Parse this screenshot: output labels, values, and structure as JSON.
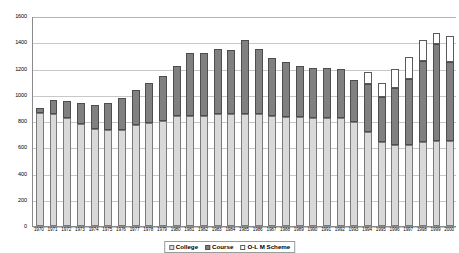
{
  "chart_data": {
    "type": "bar",
    "stacked": true,
    "title": "",
    "xlabel": "",
    "ylabel": "",
    "ylim": [
      0,
      1600
    ],
    "ytick_step": 200,
    "yticks": [
      0,
      200,
      400,
      600,
      800,
      1000,
      1200,
      1400,
      1600
    ],
    "grid": true,
    "legend_position": "bottom",
    "categories": [
      "1970",
      "1971",
      "1972",
      "1973",
      "1974",
      "1975",
      "1976",
      "1977",
      "1978",
      "1979",
      "1980",
      "1981",
      "1982",
      "1983",
      "1984",
      "1985",
      "1986",
      "1987",
      "1988",
      "1989",
      "1990",
      "1991",
      "1992",
      "1993",
      "1994",
      "1995",
      "1996",
      "1997",
      "1998",
      "1999",
      "2000"
    ],
    "series": [
      {
        "name": "College",
        "color": "#d9d9d9",
        "values": [
          860,
          855,
          820,
          775,
          740,
          730,
          735,
          770,
          785,
          800,
          840,
          840,
          840,
          850,
          850,
          855,
          850,
          840,
          830,
          830,
          825,
          825,
          820,
          790,
          720,
          640,
          620,
          620,
          640,
          650,
          650
        ]
      },
      {
        "name": "Course",
        "color": "#808080",
        "values": [
          40,
          105,
          130,
          165,
          185,
          205,
          240,
          270,
          305,
          345,
          380,
          480,
          480,
          500,
          490,
          560,
          500,
          440,
          420,
          390,
          380,
          380,
          380,
          320,
          360,
          340,
          430,
          500,
          615,
          740,
          600
        ]
      },
      {
        "name": "O-L M Scheme",
        "color": "#ffffff",
        "values": [
          0,
          0,
          0,
          0,
          0,
          0,
          0,
          0,
          0,
          0,
          0,
          0,
          0,
          0,
          0,
          0,
          0,
          0,
          0,
          0,
          0,
          0,
          0,
          0,
          95,
          110,
          150,
          170,
          160,
          80,
          200
        ]
      }
    ],
    "totals": [
      900,
      960,
      950,
      940,
      925,
      935,
      975,
      1040,
      1090,
      1145,
      1220,
      1320,
      1320,
      1350,
      1340,
      1415,
      1350,
      1280,
      1250,
      1220,
      1205,
      1205,
      1200,
      1110,
      1175,
      1090,
      1200,
      1290,
      1415,
      1470,
      1450
    ]
  },
  "legend": {
    "items": [
      {
        "label": "College",
        "swatch": "sw-college"
      },
      {
        "label": "Course",
        "swatch": "sw-course"
      },
      {
        "label": "O-L M Scheme",
        "swatch": "sw-olm"
      }
    ]
  }
}
